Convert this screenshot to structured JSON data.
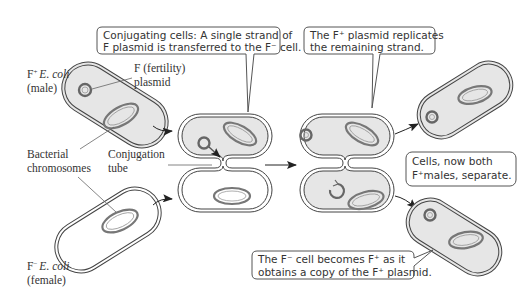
{
  "labels": {
    "male_line1_prefix": "F",
    "male_line1_sup": "+",
    "male_line1_species": "E. coli",
    "male_line2": "(male)",
    "plasmid_line1": "F (fertility)",
    "plasmid_line2": "plasmid",
    "chromosomes_line1": "Bacterial",
    "chromosomes_line2": "chromosomes",
    "tube_line1": "Conjugation",
    "tube_line2": "tube",
    "female_line1_prefix": "F",
    "female_line1_sup": "−",
    "female_line1_species": "E. coli",
    "female_line2": "(female)"
  },
  "callouts": {
    "conjugating": {
      "line1": "Conjugating cells: A single strand of",
      "line2": "F plasmid is transferred to the  F⁻ cell."
    },
    "replicates": {
      "line1": "The F⁺ plasmid replicates",
      "line2": "the remaining strand."
    },
    "separate": {
      "line1": "Cells, now both",
      "line2": "F⁺males, separate."
    },
    "becomes": {
      "line1": "The F⁻ cell becomes F⁺ as it",
      "line2": "obtains a copy of the F⁺ plasmid."
    }
  },
  "colors": {
    "cell_fill_male": "#e6e6e6",
    "cell_fill_female": "#ffffff",
    "chromosome": "#777777",
    "plasmid": "#666666",
    "outline": "#444444"
  }
}
